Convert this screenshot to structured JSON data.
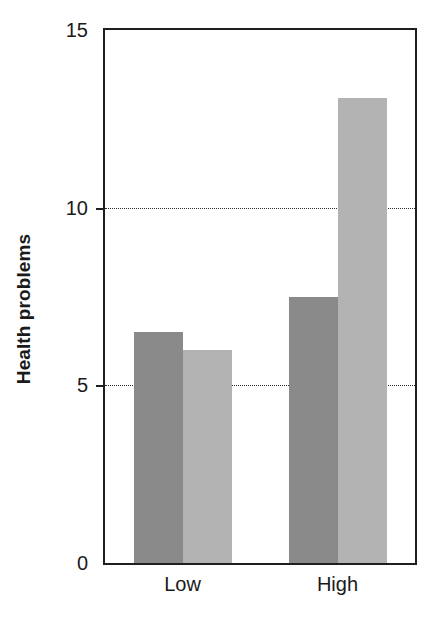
{
  "chart_data": {
    "type": "bar",
    "title": "",
    "xlabel": "",
    "ylabel": "Health problems",
    "categories": [
      "Low",
      "High"
    ],
    "series": [
      {
        "name": "series-1",
        "color": "#8a8a8a",
        "values": [
          6.5,
          7.5
        ]
      },
      {
        "name": "series-2",
        "color": "#b3b3b3",
        "values": [
          6.0,
          13.1
        ]
      }
    ],
    "ylim": [
      0,
      15
    ],
    "yticks": [
      0,
      5,
      10,
      15
    ],
    "ytick_labels": [
      "0",
      "5",
      "10",
      "15"
    ],
    "gridlines_at": [
      5,
      10
    ],
    "grid": true,
    "legend": "none",
    "annotations": []
  },
  "axis": {
    "y_title": "Health problems",
    "tick_0": "0",
    "tick_5": "5",
    "tick_10": "10",
    "tick_15": "15",
    "cat_low": "Low",
    "cat_high": "High"
  },
  "colors": {
    "bar_dark": "#8a8a8a",
    "bar_light": "#b3b3b3",
    "axis": "#1f1f1f",
    "grid": "#2b2b2b",
    "text": "#1a1a1a",
    "background": "#ffffff"
  }
}
